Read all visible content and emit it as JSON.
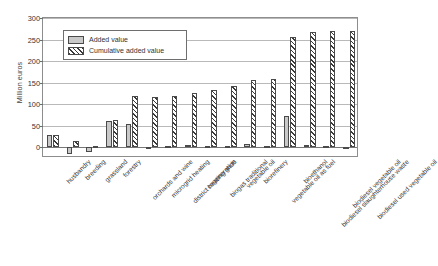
{
  "chart_data": {
    "type": "bar",
    "title": "",
    "xlabel": "",
    "ylabel": "Million euros",
    "ylim": [
      -25,
      300
    ],
    "yticks": [
      0,
      50,
      100,
      150,
      200,
      250,
      300
    ],
    "grid": true,
    "legend_position": "top-left",
    "categories": [
      "husbandry",
      "breeding",
      "grassland",
      "forestry",
      "orchards and wine",
      "microgrid heating",
      "district heating grids",
      "cogeneration",
      "biogas traditional",
      "vegetable oil",
      "biorefinery",
      "vegetable oil as fuel",
      "bioethanol",
      "biodiesel slaughterhouse waste",
      "biodiesel vegetable oil",
      "biodiesel used vegetable oil"
    ],
    "series": [
      {
        "name": "Added value",
        "values": [
          28,
          -16,
          -11,
          60,
          53,
          -2,
          4,
          5,
          2,
          3,
          7,
          3,
          73,
          6,
          2,
          1
        ]
      },
      {
        "name": "Cumulative added value",
        "values": [
          28,
          14,
          2,
          63,
          118,
          116,
          120,
          125,
          132,
          142,
          155,
          158,
          255,
          268,
          270,
          270
        ]
      }
    ]
  },
  "legend": {
    "items": [
      {
        "label": "Added value",
        "pattern": "solid-gray",
        "color": "#c9c9c9"
      },
      {
        "label": "Cumulative added value",
        "pattern": "diagonal-hatch",
        "color": "#3a3a3a"
      }
    ]
  },
  "axis": {
    "y_title": "Million euros",
    "y_tick_labels": [
      "300",
      "250",
      "200",
      "150",
      "100",
      "50",
      "0"
    ]
  }
}
